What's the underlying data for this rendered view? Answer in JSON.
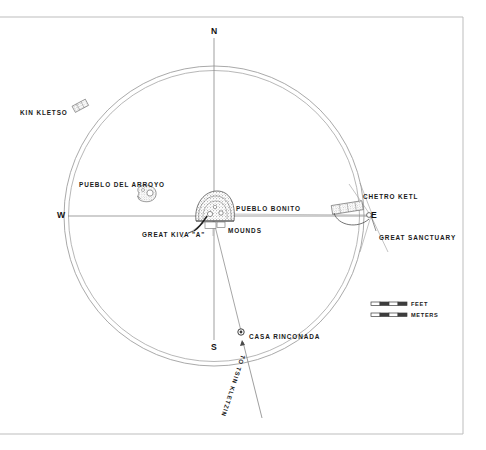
{
  "map": {
    "title_hidden": "",
    "cardinals": [
      {
        "id": "north",
        "label": "N",
        "x": 211,
        "y": 27
      },
      {
        "id": "south",
        "label": "S",
        "x": 211,
        "y": 343
      },
      {
        "id": "west",
        "label": "W",
        "x": 57,
        "y": 211
      },
      {
        "id": "east",
        "label": "E",
        "x": 371,
        "y": 211
      }
    ],
    "sites": [
      {
        "id": "kin-kletso",
        "label": "KIN KLETSO",
        "x": 20,
        "y": 110
      },
      {
        "id": "pueblo-del-arroyo",
        "label": "PUEBLO DEL ARROYO",
        "x": 79,
        "y": 182
      },
      {
        "id": "pueblo-bonito",
        "label": "PUEBLO BONITO",
        "x": 236,
        "y": 206
      },
      {
        "id": "mounds",
        "label": "MOUNDS",
        "x": 228,
        "y": 228
      },
      {
        "id": "great-kiva-a",
        "label": "GREAT KIVA \"A\"",
        "x": 142,
        "y": 232
      },
      {
        "id": "chetro-ketl",
        "label": "CHETRO KETL",
        "x": 363,
        "y": 194
      },
      {
        "id": "great-sanctuary",
        "label": "GREAT SANCTUARY",
        "x": 379,
        "y": 235
      },
      {
        "id": "casa-rinconada",
        "label": "CASA RINCONADA",
        "x": 249,
        "y": 334
      }
    ],
    "route": {
      "id": "to-tsin-kletzin",
      "label": "TO TSIN KLETZIN",
      "x": 246,
      "y": 356,
      "rotation_deg": 108
    },
    "scale_bars": [
      {
        "id": "feet",
        "label": "FEET",
        "x": 411,
        "y": 306
      },
      {
        "id": "meters",
        "label": "METERS",
        "x": 411,
        "y": 317
      }
    ],
    "colors": {
      "ink": "#1a1a1a",
      "line": "#8a8a8a",
      "frame": "#b9b9b9",
      "ruin_fill": "#6d6d6d",
      "paper": "#ffffff"
    },
    "geometry": {
      "circle_center_x": 214,
      "circle_center_y": 216,
      "circle_radius_outer": 150,
      "circle_radius_inner": 146
    }
  }
}
